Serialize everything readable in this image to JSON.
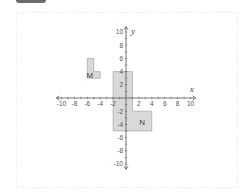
{
  "diagram": {
    "type": "coordinate-plane",
    "axes": {
      "x_label": "x",
      "y_label": "y",
      "x_range": [
        -10,
        10
      ],
      "y_range": [
        -10,
        10
      ],
      "x_tick_labels": [
        "-10",
        "-8",
        "-6",
        "-4",
        "-2",
        "2",
        "4",
        "6",
        "8",
        "10"
      ],
      "y_tick_labels": [
        "10",
        "8",
        "6",
        "4",
        "2",
        "-2",
        "-4",
        "-6",
        "-8",
        "-10"
      ]
    },
    "shapes": [
      {
        "label": "M",
        "vertices": [
          [
            -6,
            6
          ],
          [
            -5,
            6
          ],
          [
            -5,
            4
          ],
          [
            -4,
            4
          ],
          [
            -4,
            3
          ],
          [
            -6,
            3
          ]
        ],
        "fill": "#d9d9d9"
      },
      {
        "label": "N",
        "vertices": [
          [
            -2,
            4
          ],
          [
            1,
            4
          ],
          [
            1,
            -2
          ],
          [
            4,
            -2
          ],
          [
            4,
            -5
          ],
          [
            -2,
            -5
          ]
        ],
        "fill": "#d9d9d9"
      }
    ],
    "colors": {
      "axis": "#555555",
      "shape_fill": "#d9d9d9",
      "shape_stroke": "#9a9a9a"
    }
  }
}
